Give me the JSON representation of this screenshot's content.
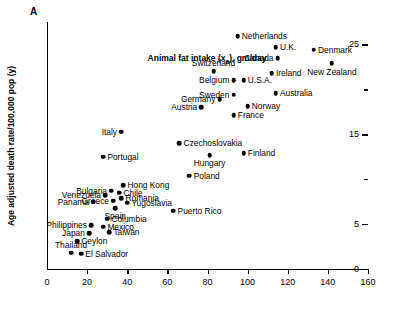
{
  "panel": {
    "letter": "A"
  },
  "chart_data": {
    "type": "scatter",
    "title": "",
    "xlabel": "Animal fat intake (xₐ), gm/day",
    "xlabel_main": "Animal fat intake (x",
    "xlabel_sub": "a",
    "xlabel_tail": "), gm/day",
    "ylabel": "Age adjusted death rate/100,000 pop (y)",
    "xlim": [
      0,
      160
    ],
    "ylim": [
      0,
      27.5
    ],
    "xticks": [
      0,
      20,
      40,
      60,
      80,
      100,
      120,
      140,
      160
    ],
    "xticklabels": [
      "0",
      "20",
      "40",
      "60",
      "80",
      "100",
      "120",
      "140",
      "160"
    ],
    "yticks": [
      0,
      5,
      10,
      15,
      20,
      25
    ],
    "yticklabels": [
      "0",
      "5",
      "",
      "15",
      "",
      "25"
    ],
    "ytick_major": [
      0,
      5,
      15,
      25
    ],
    "grid": false,
    "legend": null,
    "points": [
      {
        "label": "Netherlands",
        "x": 95,
        "y": 25.9,
        "pos": "right"
      },
      {
        "label": "U.K.",
        "x": 114,
        "y": 24.7,
        "pos": "right"
      },
      {
        "label": "Denmark",
        "x": 133,
        "y": 24.4,
        "pos": "right"
      },
      {
        "label": "Canada",
        "x": 115,
        "y": 23.5,
        "pos": "left"
      },
      {
        "label": "New Zealand",
        "x": 142,
        "y": 22.9,
        "pos": "below"
      },
      {
        "label": "Switzerland",
        "x": 83,
        "y": 22.0,
        "pos": "above"
      },
      {
        "label": "Ireland",
        "x": 112,
        "y": 21.8,
        "pos": "right"
      },
      {
        "label": "Belgium",
        "x": 93,
        "y": 21.0,
        "pos": "left"
      },
      {
        "label": "U.S.A.",
        "x": 98,
        "y": 21.0,
        "pos": "right"
      },
      {
        "label": "Australia",
        "x": 114,
        "y": 19.6,
        "pos": "right"
      },
      {
        "label": "Sweden",
        "x": 93,
        "y": 19.4,
        "pos": "left"
      },
      {
        "label": "Germany",
        "x": 86,
        "y": 18.9,
        "pos": "left"
      },
      {
        "label": "Norway",
        "x": 100,
        "y": 18.1,
        "pos": "right"
      },
      {
        "label": "Austria",
        "x": 77,
        "y": 18.0,
        "pos": "left"
      },
      {
        "label": "France",
        "x": 93,
        "y": 17.1,
        "pos": "right"
      },
      {
        "label": "Italy",
        "x": 37,
        "y": 15.3,
        "pos": "left"
      },
      {
        "label": "Czechoslovakia",
        "x": 66,
        "y": 14.0,
        "pos": "right"
      },
      {
        "label": "Finland",
        "x": 98,
        "y": 12.9,
        "pos": "right"
      },
      {
        "label": "Hungary",
        "x": 81,
        "y": 12.7,
        "pos": "below"
      },
      {
        "label": "Portugal",
        "x": 28,
        "y": 12.5,
        "pos": "right"
      },
      {
        "label": "Poland",
        "x": 71,
        "y": 10.4,
        "pos": "right"
      },
      {
        "label": "Hong Kong",
        "x": 38,
        "y": 9.3,
        "pos": "right"
      },
      {
        "label": "Bulgaria",
        "x": 32,
        "y": 8.7,
        "pos": "left"
      },
      {
        "label": "Chile",
        "x": 36,
        "y": 8.5,
        "pos": "right"
      },
      {
        "label": "Venezuela",
        "x": 29,
        "y": 8.2,
        "pos": "left"
      },
      {
        "label": "Romania",
        "x": 37,
        "y": 7.9,
        "pos": "right"
      },
      {
        "label": "Greece",
        "x": 33,
        "y": 7.6,
        "pos": "left"
      },
      {
        "label": "Panama",
        "x": 23,
        "y": 7.5,
        "pos": "left"
      },
      {
        "label": "Yugoslavia",
        "x": 40,
        "y": 7.4,
        "pos": "right"
      },
      {
        "label": "Spain",
        "x": 34,
        "y": 6.8,
        "pos": "below"
      },
      {
        "label": "Puerto Rico",
        "x": 63,
        "y": 6.5,
        "pos": "right"
      },
      {
        "label": "Columbia",
        "x": 30,
        "y": 5.6,
        "pos": "right"
      },
      {
        "label": "Philippines",
        "x": 22,
        "y": 4.9,
        "pos": "left"
      },
      {
        "label": "Mexico",
        "x": 28,
        "y": 4.7,
        "pos": "right"
      },
      {
        "label": "Taiwan",
        "x": 31,
        "y": 4.1,
        "pos": "right"
      },
      {
        "label": "Japan",
        "x": 21,
        "y": 4.0,
        "pos": "left"
      },
      {
        "label": "Ceylon",
        "x": 15,
        "y": 3.1,
        "pos": "right"
      },
      {
        "label": "Thailand",
        "x": 12,
        "y": 1.8,
        "pos": "above"
      },
      {
        "label": "El Salvador",
        "x": 17,
        "y": 1.7,
        "pos": "right"
      }
    ]
  }
}
